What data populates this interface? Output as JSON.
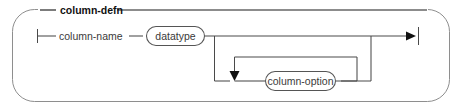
{
  "diagram": {
    "kind": "railroad-syntax-diagram",
    "title": "column-defn",
    "nodes": {
      "column_name": "column-name",
      "datatype": "datatype",
      "column_option": "column-option"
    },
    "terminals": {
      "start": "start-bar",
      "end": "end-arrow-bar"
    },
    "icons": {
      "loop_down_arrow": "arrow-down-icon",
      "track_end_arrow": "arrow-right-icon"
    },
    "colors": {
      "frame": "#8e8e8e",
      "track": "#4a4a4a",
      "title_rule": "#1b1b1b",
      "label_text": "#3a3a3a",
      "title_text": "#111111",
      "bubble_fill": "#ffffff",
      "bubble_stroke": "#555555",
      "background": "#ffffff"
    },
    "reading_order": [
      "column-name",
      "datatype",
      "column-option"
    ]
  }
}
